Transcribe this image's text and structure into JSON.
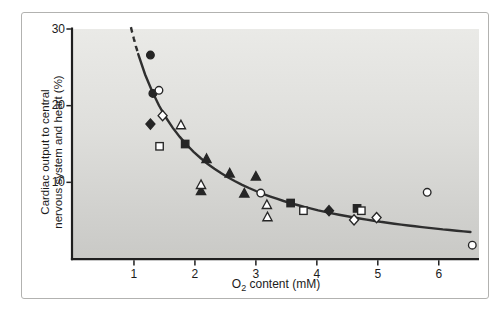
{
  "figure": {
    "xlabel": {
      "prefix": "O",
      "sub": "2",
      "suffix": " content (mM)"
    },
    "ylabel": {
      "line1": "Cardiac output to central",
      "line2": "nervous system and heart (%)"
    }
  },
  "chart_data": {
    "type": "scatter",
    "title": "",
    "xlabel": "O2 content (mM)",
    "ylabel": "Cardiac output to central nervous system and heart (%)",
    "xlim": [
      0,
      6.66
    ],
    "ylim": [
      0,
      30
    ],
    "x_ticks": [
      1,
      2,
      3,
      4,
      5,
      6
    ],
    "y_ticks": [
      10,
      20,
      30
    ],
    "grid": false,
    "legend_position": "none",
    "series": [
      {
        "name": "filled-circle",
        "marker": "circle",
        "fill": "filled",
        "points": [
          [
            1.27,
            26.6
          ],
          [
            1.31,
            21.6
          ]
        ]
      },
      {
        "name": "filled-diamond",
        "marker": "diamond",
        "fill": "filled",
        "points": [
          [
            1.27,
            17.6
          ],
          [
            4.2,
            6.3
          ]
        ]
      },
      {
        "name": "filled-triangle",
        "marker": "triangle",
        "fill": "filled",
        "points": [
          [
            2.19,
            13.1
          ],
          [
            2.57,
            11.2
          ],
          [
            3.0,
            10.8
          ],
          [
            2.1,
            8.9
          ],
          [
            2.81,
            8.6
          ]
        ]
      },
      {
        "name": "filled-square",
        "marker": "square",
        "fill": "filled",
        "points": [
          [
            1.84,
            15.0
          ],
          [
            3.57,
            7.3
          ],
          [
            4.66,
            6.6
          ]
        ]
      },
      {
        "name": "open-square",
        "marker": "square",
        "fill": "open",
        "points": [
          [
            1.42,
            14.7
          ],
          [
            3.78,
            6.3
          ],
          [
            4.73,
            6.3
          ]
        ]
      },
      {
        "name": "open-triangle",
        "marker": "triangle",
        "fill": "open",
        "points": [
          [
            1.77,
            17.5
          ],
          [
            2.1,
            9.7
          ],
          [
            3.18,
            7.1
          ],
          [
            3.19,
            5.5
          ]
        ]
      },
      {
        "name": "open-diamond",
        "marker": "diamond",
        "fill": "open",
        "points": [
          [
            1.47,
            18.7
          ],
          [
            4.61,
            5.1
          ],
          [
            4.98,
            5.4
          ]
        ]
      },
      {
        "name": "open-circle",
        "marker": "circle",
        "fill": "open",
        "points": [
          [
            1.41,
            22.0
          ],
          [
            3.08,
            8.6
          ],
          [
            5.81,
            8.7
          ],
          [
            6.55,
            1.8
          ]
        ]
      }
    ],
    "trend_curve": {
      "model": "y = a/x + b",
      "a": 29.7,
      "b": -1.03,
      "x_start": 0.95,
      "x_dash_to_solid": 1.07,
      "x_end": 6.52,
      "dashed_segment": "x < 1.07"
    },
    "colors": {
      "marker": "#262626",
      "curve": "#2f2f2f",
      "axis": "#1f1f1f",
      "plot_bg_top": "#eaeae7",
      "plot_bg_bottom": "#c9c9c6",
      "frame_border": "#b2b2b0"
    }
  }
}
